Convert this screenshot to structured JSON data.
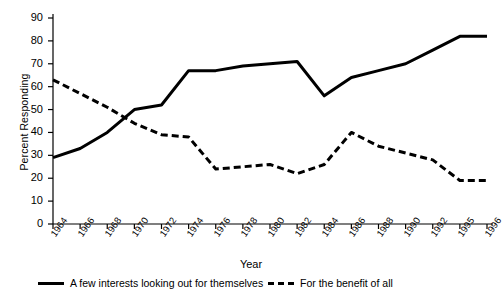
{
  "chart_data": {
    "type": "line",
    "title": "",
    "xlabel": "Year",
    "ylabel": "Percent Responding",
    "ylim": [
      0,
      90
    ],
    "ytick_step": 10,
    "yticks": [
      0,
      10,
      20,
      30,
      40,
      50,
      60,
      70,
      80,
      90
    ],
    "grid": false,
    "legend_position": "bottom",
    "categories": [
      "1964",
      "1966",
      "1968",
      "1970",
      "1972",
      "1974",
      "1976",
      "1978",
      "1980",
      "1982",
      "1984",
      "1986",
      "1988",
      "1990",
      "1992",
      "1995",
      "1996"
    ],
    "series": [
      {
        "name": "A few interests looking out for themselves",
        "style": "solid",
        "color": "#000000",
        "values": [
          29,
          33,
          40,
          50,
          52,
          67,
          67,
          69,
          70,
          71,
          56,
          64,
          67,
          70,
          76,
          82,
          82
        ]
      },
      {
        "name": "For the benefit of all",
        "style": "dashed",
        "color": "#000000",
        "values": [
          63,
          57,
          51,
          44,
          39,
          38,
          24,
          25,
          26,
          22,
          26,
          40,
          34,
          31,
          28,
          19,
          19
        ]
      }
    ]
  },
  "axes": {
    "ylabel": "Percent Responding",
    "xlabel": "Year",
    "ytick_labels": [
      "90",
      "80",
      "70",
      "60",
      "50",
      "40",
      "30",
      "20",
      "10",
      "0"
    ],
    "xtick_labels": [
      "1964",
      "1966",
      "1968",
      "1970",
      "1972",
      "1974",
      "1976",
      "1978",
      "1980",
      "1982",
      "1984",
      "1986",
      "1988",
      "1990",
      "1992",
      "1995",
      "1996"
    ]
  },
  "legend": {
    "entries": [
      {
        "label": "A few interests looking out for themselves",
        "style": "solid"
      },
      {
        "label": "For the benefit of all",
        "style": "dashed"
      }
    ]
  },
  "top_caption": "",
  "colors": {
    "ink": "#000000",
    "axis": "#000000",
    "background": "#ffffff"
  }
}
